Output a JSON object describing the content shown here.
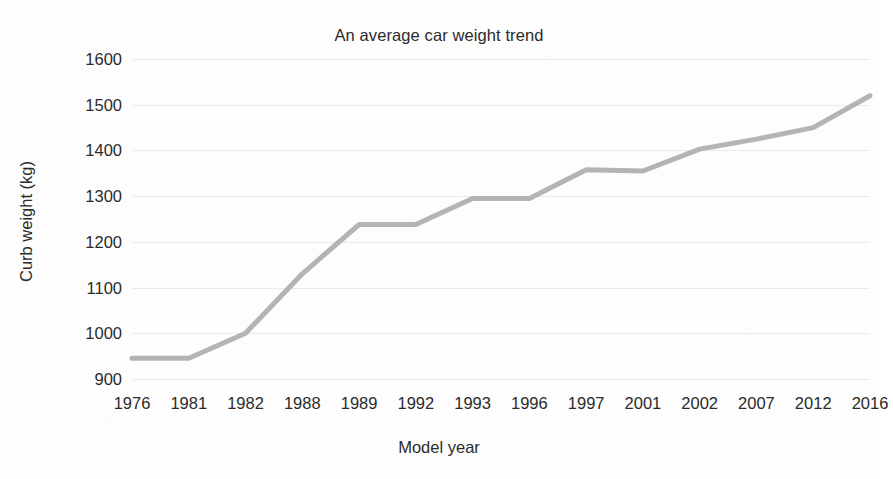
{
  "chart_data": {
    "type": "line",
    "title": "An average car weight trend",
    "xlabel": "Model year",
    "ylabel": "Curb weight (kg)",
    "categories": [
      "1976",
      "1981",
      "1982",
      "1988",
      "1989",
      "1992",
      "1993",
      "1996",
      "1997",
      "2001",
      "2002",
      "2007",
      "2012",
      "2016"
    ],
    "values": [
      945,
      945,
      1000,
      1130,
      1238,
      1238,
      1295,
      1295,
      1358,
      1355,
      1403,
      1425,
      1450,
      1520
    ],
    "series": [
      {
        "name": "Curb weight",
        "values": [
          945,
          945,
          1000,
          1130,
          1238,
          1238,
          1295,
          1295,
          1358,
          1355,
          1403,
          1425,
          1450,
          1520
        ],
        "color": "#b4b4b4"
      }
    ],
    "ylim": [
      880,
      1620
    ],
    "yticks": [
      900,
      1000,
      1100,
      1200,
      1300,
      1400,
      1500,
      1600
    ],
    "ytick_labels": [
      "900",
      "1000",
      "1100",
      "1200",
      "1300",
      "1400",
      "1500",
      "1600"
    ],
    "grid": true,
    "grid_color": "#e9e9e9",
    "legend": false,
    "legend_position": "none",
    "line_width": 5,
    "background": "#fdfdfd",
    "text_color": "#2b2b2b"
  }
}
